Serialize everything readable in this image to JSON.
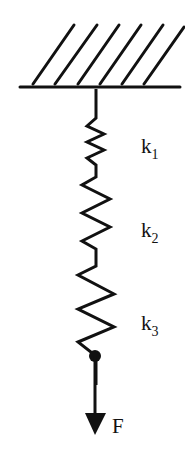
{
  "diagram": {
    "type": "series spring system",
    "springs": [
      {
        "label": "k",
        "subscript": "1"
      },
      {
        "label": "k",
        "subscript": "2"
      },
      {
        "label": "k",
        "subscript": "3"
      }
    ],
    "force": {
      "label": "F"
    },
    "colors": {
      "stroke": "#111111",
      "background": "#ffffff"
    }
  }
}
